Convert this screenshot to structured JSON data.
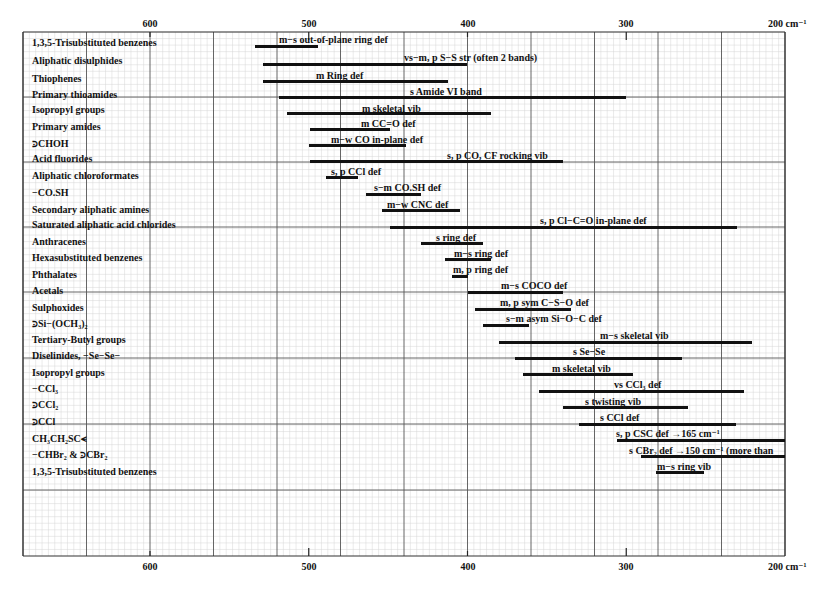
{
  "chart_data": {
    "type": "range-bar",
    "title": "",
    "xlabel": "cm⁻¹",
    "x_axis": {
      "reversed": true,
      "range": [
        680,
        200
      ],
      "ticks": [
        600,
        500,
        400,
        300,
        200
      ],
      "tick_labels": [
        "600",
        "500",
        "400",
        "300",
        "200 cm⁻¹"
      ],
      "major_grid_step": 40,
      "minor_grid_step": 4,
      "position": "top and bottom"
    },
    "grid": true,
    "rows": [
      {
        "group": "1,3,5-Trisubstituted benzenes",
        "label": "m−s out-of-plane ring def",
        "from": 534,
        "to": 494
      },
      {
        "group": "Aliphatic disulphides",
        "label": "vs−m, p S−S str (often 2 bands)",
        "from": 529,
        "to": 400
      },
      {
        "group": "Thiophenes",
        "label": "m Ring def",
        "from": 529,
        "to": 412
      },
      {
        "group": "Primary thioamides",
        "label": "s Amide VI band",
        "from": 519,
        "to": 300
      },
      {
        "group": "Isopropyl groups",
        "label": "m skeletal vib",
        "from": 514,
        "to": 385
      },
      {
        "group": "Primary amides",
        "label": "m CC=O def",
        "from": 499,
        "to": 449
      },
      {
        "group": ">CHOH",
        "label": "m−w CO in-plane def",
        "from": 500,
        "to": 439
      },
      {
        "group": "Acid fluorides",
        "label": "s, p CO, CF rocking vib",
        "from": 499,
        "to": 340
      },
      {
        "group": "Aliphatic chloroformates",
        "label": "s, p CCl def",
        "from": 489,
        "to": 469
      },
      {
        "group": "−CO.SH",
        "label": "s−m CO.SH def",
        "from": 464,
        "to": 429
      },
      {
        "group": "Secondary aliphatic amines",
        "label": "m−w CNC def",
        "from": 454,
        "to": 405
      },
      {
        "group": "Saturated aliphatic acid chlorides",
        "label": "s, p Cl−C=O in-plane def",
        "from": 449,
        "to": 230
      },
      {
        "group": "Anthracenes",
        "label": "s ring def",
        "from": 429,
        "to": 390
      },
      {
        "group": "Hexasubstituted benzenes",
        "label": "m−s ring def",
        "from": 414,
        "to": 385
      },
      {
        "group": "Phthalates",
        "label": "m, p ring def",
        "from": 410,
        "to": 400
      },
      {
        "group": "Acetals",
        "label": "m−s COCO def",
        "from": 400,
        "to": 340
      },
      {
        "group": "Sulphoxides",
        "label": "m, p sym C−S−O def",
        "from": 395,
        "to": 335
      },
      {
        "group": ">Si−(OCH3)2",
        "label": "s−m asym Si−O−C def",
        "from": 390,
        "to": 361
      },
      {
        "group": "Tertiary-Butyl groups",
        "label": "m−s skeletal vib",
        "from": 380,
        "to": 221
      },
      {
        "group": "Diselinides, −Se−Se−",
        "label": "s Se−Se",
        "from": 370,
        "to": 265
      },
      {
        "group": "Isopropyl groups",
        "label": "m skeletal vib",
        "from": 365,
        "to": 296
      },
      {
        "group": "−CCl3",
        "label": "vs CCl3 def",
        "from": 355,
        "to": 226
      },
      {
        "group": ">CCl2",
        "label": "s twisting vib",
        "from": 340,
        "to": 261
      },
      {
        "group": "≥CCl",
        "label": "s CCl def",
        "from": 330,
        "to": 231
      },
      {
        "group": "CH3CH2SC<",
        "label": "s, p CSC def →165 cm⁻¹",
        "from": 306,
        "to": 200
      },
      {
        "group": "−CHBr2 & >CBr2",
        "label": "s CBr2 def →150 cm⁻¹ (more than",
        "from": 291,
        "to": 200
      },
      {
        "group": "1,3,5-Trisubstituted benzenes",
        "label": "m−s ring vib",
        "from": 281,
        "to": 251
      }
    ]
  },
  "axis": {
    "top": [
      "600",
      "500",
      "400",
      "300",
      "200 cm⁻¹"
    ],
    "bottom": [
      "600",
      "500",
      "400",
      "300",
      "200 cm⁻¹"
    ]
  },
  "rows": [
    {
      "group": "1,3,5-Trisubstituted benzenes",
      "label": "m−s out-of-plane ring def"
    },
    {
      "group": "Aliphatic disulphides",
      "label": "vs−m, p S−S str (often 2 bands)"
    },
    {
      "group": "Thiophenes",
      "label": "m Ring def"
    },
    {
      "group": "Primary thioamides",
      "label": "s Amide VI band"
    },
    {
      "group": "Isopropyl groups",
      "label": "m skeletal vib"
    },
    {
      "group": "Primary amides",
      "label": "m CC=O def"
    },
    {
      "group": "⪾CHOH",
      "label": "m−w CO in-plane def"
    },
    {
      "group": "Acid fluorides",
      "label": "s, p CO, CF rocking vib"
    },
    {
      "group": "Aliphatic chloroformates",
      "label": "s, p CCl def"
    },
    {
      "group": "−CO.SH",
      "label": "s−m CO.SH def"
    },
    {
      "group": "Secondary aliphatic amines",
      "label": "m−w CNC def"
    },
    {
      "group": "Saturated aliphatic acid chlorides",
      "label": "s, p Cl−C=O in-plane def"
    },
    {
      "group": "Anthracenes",
      "label": "s ring def"
    },
    {
      "group": "Hexasubstituted benzenes",
      "label": "m−s ring def"
    },
    {
      "group": "Phthalates",
      "label": "m, p ring def"
    },
    {
      "group": "Acetals",
      "label": "m−s COCO def"
    },
    {
      "group": "Sulphoxides",
      "label": "m, p sym C−S−O def"
    },
    {
      "group": "⪾Si−(OCH₃)₂",
      "label": "s−m asym Si−O−C def"
    },
    {
      "group": "Tertiary-Butyl groups",
      "label": "m−s skeletal vib"
    },
    {
      "group": "Diselinides, −Se−Se−",
      "label": "s Se−Se"
    },
    {
      "group": "Isopropyl groups",
      "label": "m skeletal vib"
    },
    {
      "group": "−CCl₃",
      "label": "vs CCl₃ def"
    },
    {
      "group": "⪾CCl₂",
      "label": "s twisting vib"
    },
    {
      "group": "⪾CCl",
      "label": "s CCl def"
    },
    {
      "group": "CH₃CH₂SC⪪",
      "label": "s, p CSC def →165 cm⁻¹"
    },
    {
      "group": "−CHBr₂ & ⪾CBr₂",
      "label": "s CBr₂ def →150 cm⁻¹ (more than"
    },
    {
      "group": "1,3,5-Trisubstituted benzenes",
      "label": "m−s ring vib"
    }
  ]
}
